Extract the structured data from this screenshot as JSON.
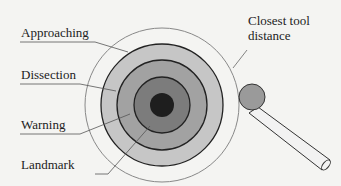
{
  "diagram": {
    "type": "concentric-zone-diagram",
    "center": [
      162,
      105
    ],
    "zones": [
      {
        "label": "Approaching",
        "radius": 61,
        "fill": "#c4c4c4"
      },
      {
        "label": "Dissection",
        "radius": 45,
        "fill": "#a0a0a0"
      },
      {
        "label": "Warning",
        "radius": 28,
        "fill": "#7a7a7a"
      },
      {
        "label": "Landmark",
        "radius": 12,
        "fill": "#1e1e1e"
      }
    ],
    "outer_boundary": {
      "label": "Closest tool distance",
      "radius": 77,
      "stroke": "#888888"
    },
    "tool": {
      "tip_center": [
        252,
        97
      ],
      "tip_radius": 13,
      "tip_fill": "#999999"
    }
  },
  "labels": {
    "approaching": "Approaching",
    "dissection": "Dissection",
    "warning": "Warning",
    "landmark": "Landmark",
    "closest_line1": "Closest tool",
    "closest_line2": "distance"
  }
}
